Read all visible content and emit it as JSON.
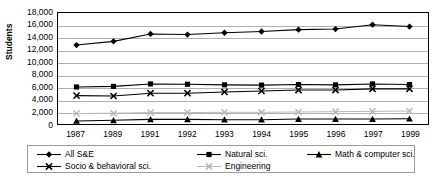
{
  "chart_data": {
    "type": "line",
    "title": "",
    "xlabel": "",
    "ylabel": "Students",
    "ylim": [
      0,
      18000
    ],
    "ytick_step": 2000,
    "grid": true,
    "legend_position": "bottom",
    "categories": [
      "1987",
      "1989",
      "1991",
      "1992",
      "1993",
      "1994",
      "1995",
      "1996",
      "1997",
      "1999"
    ],
    "ytick_labels": [
      "18,000",
      "16,000",
      "14,000",
      "12,000",
      "10,000",
      "8,000",
      "6,000",
      "4,000",
      "2,000",
      "0"
    ],
    "series": [
      {
        "name": "All S&E",
        "marker": "diamond",
        "color": "#000000",
        "values": [
          12800,
          13400,
          14600,
          14500,
          14800,
          15000,
          15300,
          15400,
          16100,
          15800
        ]
      },
      {
        "name": "Natural sci.",
        "marker": "square",
        "color": "#000000",
        "values": [
          6000,
          6100,
          6500,
          6450,
          6350,
          6300,
          6400,
          6350,
          6500,
          6400
        ]
      },
      {
        "name": "Math & computer sci.",
        "marker": "triangle",
        "color": "#000000",
        "values": [
          500,
          600,
          750,
          750,
          700,
          700,
          800,
          800,
          800,
          850
        ]
      },
      {
        "name": "Socio & behavioral sci.",
        "marker": "cross",
        "color": "#000000",
        "values": [
          4600,
          4550,
          5000,
          5000,
          5200,
          5350,
          5500,
          5500,
          5700,
          5700
        ]
      },
      {
        "name": "Engineering",
        "marker": "cross",
        "color": "#b8b8b8",
        "values": [
          1700,
          1750,
          1850,
          1850,
          1900,
          1900,
          1950,
          2000,
          2050,
          2100
        ]
      }
    ]
  },
  "legend": {
    "items": [
      {
        "label": "All S&E",
        "marker": "diamond",
        "color": "#000000"
      },
      {
        "label": "Natural sci.",
        "marker": "square",
        "color": "#000000"
      },
      {
        "label": "Math & computer sci.",
        "marker": "triangle",
        "color": "#000000"
      },
      {
        "label": "Socio & behavioral sci.",
        "marker": "cross",
        "color": "#000000"
      },
      {
        "label": "Engineering",
        "marker": "cross",
        "color": "#b8b8b8"
      }
    ]
  },
  "colors": {
    "axis": "#000000",
    "gridline": "#b0b0b0",
    "background": "#ffffff",
    "engineering_gray": "#b8b8b8"
  }
}
